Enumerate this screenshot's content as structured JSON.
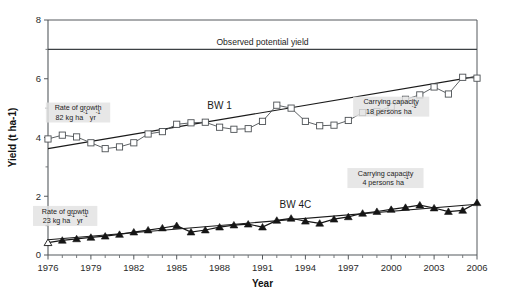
{
  "chart_data": {
    "type": "line",
    "title": "",
    "xlabel": "Year",
    "ylabel": "Yield (t ha-1)",
    "xlim": [
      1976,
      2006
    ],
    "ylim": [
      0,
      8
    ],
    "xticks": [
      1976,
      1979,
      1982,
      1985,
      1988,
      1991,
      1994,
      1997,
      2000,
      2003,
      2006
    ],
    "xtick_labels": [
      "1976",
      "1979",
      "1982",
      "1985",
      "1988",
      "1991",
      "1994",
      "1997",
      "2000",
      "2003",
      "2006"
    ],
    "yticks": [
      0,
      2,
      4,
      6,
      8
    ],
    "ytick_labels": [
      "0",
      "2",
      "4",
      "6",
      "8"
    ],
    "yticks_minor": [
      1,
      3,
      5,
      7
    ],
    "grid": false,
    "legend_position": "inline",
    "x": [
      1976,
      1977,
      1978,
      1979,
      1980,
      1981,
      1982,
      1983,
      1984,
      1985,
      1986,
      1987,
      1988,
      1989,
      1990,
      1991,
      1992,
      1993,
      1994,
      1995,
      1996,
      1997,
      1998,
      1999,
      2000,
      2001,
      2002,
      2003,
      2004,
      2005,
      2006
    ],
    "series": [
      {
        "name": "BW 1",
        "marker": "open-square",
        "values": [
          3.95,
          4.08,
          4.02,
          3.82,
          3.62,
          3.68,
          3.82,
          4.12,
          4.2,
          4.45,
          4.5,
          4.52,
          4.35,
          4.28,
          4.3,
          4.55,
          5.1,
          5.0,
          4.55,
          4.4,
          4.42,
          4.58,
          4.85,
          4.88,
          5.05,
          5.3,
          5.45,
          5.72,
          5.48,
          6.05,
          6.02
        ]
      },
      {
        "name": "BW 4C",
        "marker": "filled-triangle",
        "values": [
          0.42,
          0.5,
          0.55,
          0.6,
          0.64,
          0.7,
          0.78,
          0.85,
          0.92,
          1.0,
          0.78,
          0.85,
          0.95,
          1.02,
          1.05,
          0.95,
          1.18,
          1.25,
          1.15,
          1.08,
          1.22,
          1.3,
          1.42,
          1.48,
          1.55,
          1.62,
          1.7,
          1.6,
          1.48,
          1.52,
          1.78
        ]
      }
    ],
    "trend_lines": [
      {
        "name": "BW 1 trend",
        "x": [
          1976,
          2006
        ],
        "y": [
          3.62,
          6.08
        ]
      },
      {
        "name": "BW 4C trend",
        "x": [
          1976,
          2006
        ],
        "y": [
          0.52,
          1.73
        ]
      }
    ],
    "reference_lines": [
      {
        "name": "Observed potential yield",
        "y": 7.0,
        "label": "Observed potential yield"
      }
    ],
    "annotations": [
      {
        "id": "rate-bw1",
        "line1": "Rate of growth",
        "line2_main": "82 kg ha",
        "line2_sup1": "-1",
        "line2_mid": " yr",
        "line2_sup2": "-1",
        "x": 1978.1,
        "y": 4.85
      },
      {
        "id": "capacity-bw1",
        "line1": "Carrying capacity",
        "line2_main": "18 persons ha",
        "line2_sup1": "-1",
        "line2_mid": "",
        "line2_sup2": "",
        "x": 2000.0,
        "y": 5.05
      },
      {
        "id": "rate-bw4c",
        "line1": "Rate of growth",
        "line2_main": "23 kg ha",
        "line2_sup1": "-1",
        "line2_mid": " yr",
        "line2_sup2": "-1",
        "x": 1977.2,
        "y": 1.33
      },
      {
        "id": "capacity-bw4c",
        "line1": "Carrying capacity",
        "line2_main": "4 persons ha",
        "line2_sup1": "-1",
        "line2_mid": "",
        "line2_sup2": "",
        "x": 1999.6,
        "y": 2.62
      }
    ],
    "series_labels": [
      {
        "id": "label-bw1",
        "text": "BW 1",
        "x": 1988.0,
        "y": 4.98
      },
      {
        "id": "label-bw4c",
        "text": "BW 4C",
        "x": 1993.3,
        "y": 1.6
      }
    ],
    "colors": {
      "bw1_line": "#4c5054",
      "bw1_marker_fill": "#ffffff",
      "bw4c_line": "#161616",
      "bw4c_marker_fill": "#151515",
      "trend": "#1a1a1a",
      "axis": "#55595d",
      "annotation_bg": "#e2e2e2",
      "background": "#ffffff"
    }
  }
}
